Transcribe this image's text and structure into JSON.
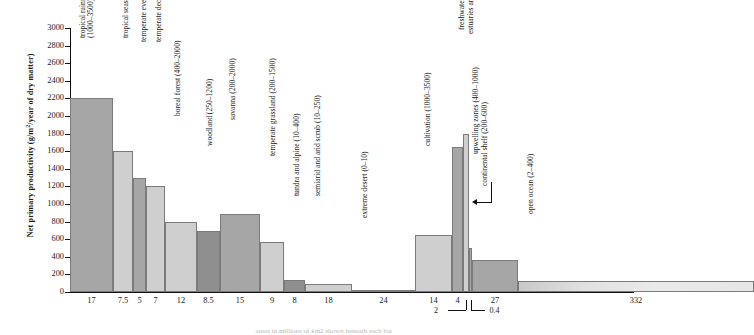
{
  "chart_data": {
    "type": "bar",
    "title": "",
    "xlabel": "",
    "ylabel": "Net primary productivity (g/m2/year of dry matter)",
    "ylabel_parts": {
      "prefix": "Net primary productivity (g/m",
      "sup": "2",
      "suffix": "/year of dry matter)"
    },
    "ylim": [
      0,
      3000
    ],
    "ytick_step": 200,
    "yticks": [
      "3000",
      "2800",
      "2600",
      "2400",
      "2200",
      "2000",
      "1800",
      "1600",
      "1400",
      "1200",
      "1000",
      "800",
      "600",
      "400",
      "200",
      "0"
    ],
    "grid": false,
    "legend": "none",
    "x_axis_note": "Bar widths are proportional to area (millions of km2); the number under each bar is that area.",
    "categories": [
      "tropical rainforest",
      "tropical seasonal forest",
      "temperate evergreen forest",
      "temperate deciduous forest",
      "boreal forest",
      "woodland",
      "savanna",
      "temperate grassland",
      "tundra and alpine",
      "semiarid and arid scrub",
      "extreme desert",
      "cultivation",
      "freshwater ecosystems",
      "estuaries and reefs",
      "upwelling zones",
      "continental shelf",
      "open ocean"
    ],
    "values": [
      2200,
      1600,
      1300,
      1200,
      800,
      690,
      890,
      570,
      140,
      90,
      3,
      650,
      1650,
      1800,
      500,
      360,
      125
    ],
    "ranges": [
      "1000–3500",
      "1000–2500",
      "600–2500",
      "600–2500",
      "400–2000",
      "250–1200",
      "200–2000",
      "200–1500",
      "10–400",
      "10–250",
      "0–10",
      "1000–3500",
      "100–6000",
      "200–4000",
      "400–1000",
      "200–600",
      "2–400"
    ],
    "areas": [
      17,
      7.5,
      5,
      7,
      12,
      8.5,
      15,
      9,
      8,
      18,
      24,
      14,
      4,
      2,
      0.4,
      27,
      332
    ],
    "bar_labels": [
      "tropical rainforest (1000–3500)",
      "tropical seasonal forest (1000–2500)",
      "temperate evergreen forest (600–2500)",
      "temperate deciduous forest (600–2500)",
      "boreal forest (400–2000)",
      "woodland (250–1200)",
      "savanna (200–2000)",
      "temperate grassland (200–1500)",
      "tundra and alpine (10–400)",
      "semiarid and arid scrub (10–250)",
      "extreme desert (0–10)",
      "cultivation (1000–3500)",
      "freshwater ecosystems (100–6000)",
      "estuaries and reefs (200–4000)",
      "upwelling zones (400–1000)",
      "continental shelf (200–600)",
      "open ocean (2–400)"
    ],
    "bar_label_two_line": [
      [
        "tropical rainforest",
        "(1000–3500)"
      ]
    ],
    "xtick_labels": [
      "17",
      "7.5",
      "5",
      "7",
      "12",
      "8.5",
      "15",
      "9",
      "8",
      "18",
      "24",
      "14",
      "4",
      "2",
      "0.4",
      "27",
      "332"
    ],
    "leader_labels": [
      "2",
      "0.4"
    ],
    "colors": {
      "dark": "#a6a6a6",
      "light": "#cfcfcf",
      "darker": "#8f8f8f",
      "very_light": "#dddddd",
      "outline": "#7b7b7b",
      "axis": "#111111"
    }
  },
  "caption": {
    "text": "areas in millions of km2 shown beneath each bar"
  }
}
